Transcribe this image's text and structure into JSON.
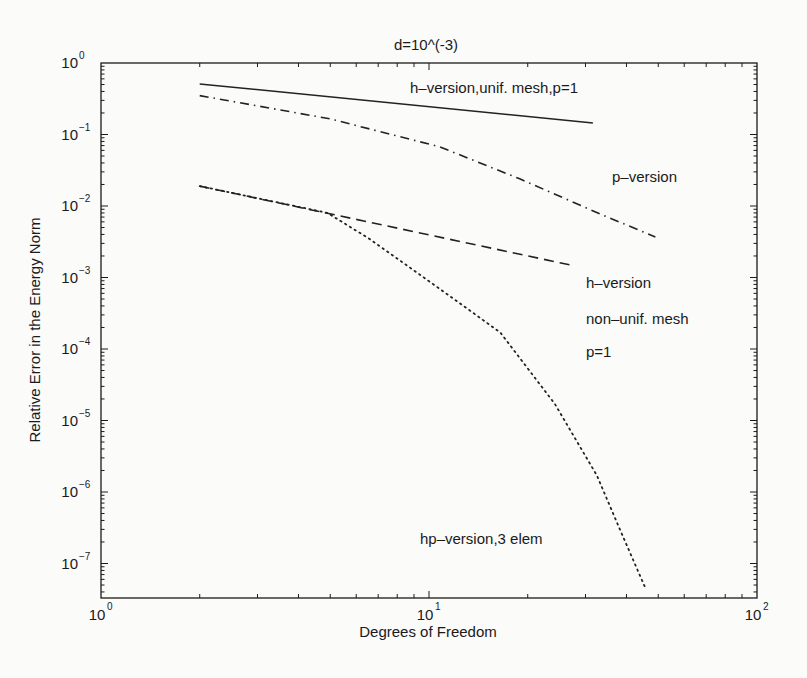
{
  "chart_data": {
    "type": "line",
    "title": "d=10^(-3)",
    "xlabel": "Degrees of Freedom",
    "ylabel": "Relative Error in the Energy Norm",
    "xscale": "log",
    "yscale": "log",
    "xlim": [
      1,
      100
    ],
    "ylim": [
      3.3e-08,
      1
    ],
    "grid": false,
    "legend": "none (inline text annotations)",
    "x_ticks": [
      {
        "value": 1,
        "base": "10",
        "exp": "0"
      },
      {
        "value": 10,
        "base": "10",
        "exp": "1"
      },
      {
        "value": 100,
        "base": "10",
        "exp": "2"
      }
    ],
    "y_ticks": [
      {
        "value": 1,
        "base": "10",
        "exp": "0"
      },
      {
        "value": 0.1,
        "base": "10",
        "exp": "-1"
      },
      {
        "value": 0.01,
        "base": "10",
        "exp": "-2"
      },
      {
        "value": 0.001,
        "base": "10",
        "exp": "-3"
      },
      {
        "value": 0.0001,
        "base": "10",
        "exp": "-4"
      },
      {
        "value": 1e-05,
        "base": "10",
        "exp": "-5"
      },
      {
        "value": 1e-06,
        "base": "10",
        "exp": "-6"
      },
      {
        "value": 1e-07,
        "base": "10",
        "exp": "-7"
      }
    ],
    "series": [
      {
        "name": "h-version,unif. mesh,p=1",
        "style": "solid",
        "x": [
          2.0,
          31.6
        ],
        "y": [
          0.51,
          0.145
        ]
      },
      {
        "name": "p-version",
        "style": "dashdot",
        "x": [
          2.0,
          5.0,
          10.8,
          18.9,
          33.3,
          49.0
        ],
        "y": [
          0.35,
          0.165,
          0.067,
          0.024,
          0.0077,
          0.0037
        ]
      },
      {
        "name": "h-version non-unif. mesh p=1",
        "style": "dashed",
        "x": [
          2.0,
          26.9
        ],
        "y": [
          0.019,
          0.0015
        ]
      },
      {
        "name": "hp-version,3 elem",
        "style": "dotted",
        "x": [
          2.0,
          4.9,
          6.5,
          8.2,
          11.0,
          16.5,
          24.2,
          32.5,
          38.2,
          45.8
        ],
        "y": [
          0.019,
          0.008,
          0.0036,
          0.0017,
          0.00065,
          0.00017,
          1.7e-05,
          1.7e-06,
          3e-07,
          4.4e-08
        ]
      }
    ],
    "annotations": [
      {
        "text": "h-version,unif. mesh,p=1",
        "x_px": 410,
        "y_px": 93
      },
      {
        "text": "p-version",
        "x_px": 612,
        "y_px": 182
      },
      {
        "text": "h-version",
        "x_px": 586,
        "y_px": 288
      },
      {
        "text": "non-unif. mesh",
        "x_px": 586,
        "y_px": 324
      },
      {
        "text": "p=1",
        "x_px": 586,
        "y_px": 357
      },
      {
        "text": "hp-version,3 elem",
        "x_px": 420,
        "y_px": 544
      }
    ]
  }
}
